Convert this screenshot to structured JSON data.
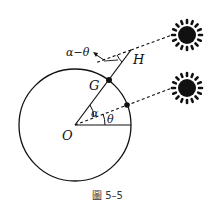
{
  "figure": {
    "caption": "圖 5–5",
    "labels": {
      "O": "O",
      "G": "G",
      "H": "H",
      "alpha": "α",
      "theta": "θ",
      "alpha_minus_theta": "α−θ"
    },
    "colors": {
      "stroke": "#111111",
      "caption": "#333333",
      "background": "#ffffff"
    },
    "elements": [
      "circle (Earth) centered at O",
      "radius OG extended to H",
      "horizontal radius",
      "dashed ray from O at angle θ to second point on circle",
      "dashed sun rays to H and to circle point",
      "two suns",
      "angle α at O",
      "angle θ at O",
      "angle α−θ at H"
    ]
  }
}
